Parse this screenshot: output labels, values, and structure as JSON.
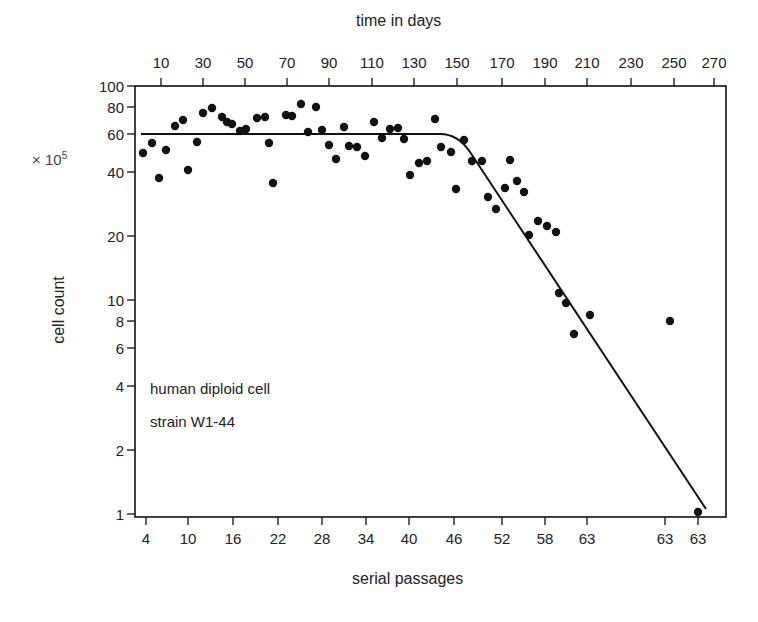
{
  "chart_data": {
    "type": "scatter",
    "title": "",
    "top_xlabel": "time in days",
    "xlabel": "serial passages",
    "ylabel": "cell count",
    "y_multiplier": "× 10^5",
    "y_scale": "log",
    "ylim": [
      1,
      100
    ],
    "grid": false,
    "legend": null,
    "annotation": [
      "human diploid cell",
      "strain W1-44"
    ],
    "y_ticks": [
      100,
      80,
      60,
      40,
      20,
      10,
      8,
      6,
      4,
      2,
      1
    ],
    "bottom_x_ticks": [
      "4",
      "10",
      "16",
      "22",
      "28",
      "34",
      "40",
      "46",
      "52",
      "58",
      "63",
      "63",
      "63"
    ],
    "top_x_ticks": [
      "10",
      "30",
      "50",
      "70",
      "90",
      "110",
      "130",
      "150",
      "170",
      "190",
      "210",
      "230",
      "250",
      "270"
    ],
    "series": [
      {
        "name": "observed cell count",
        "kind": "points",
        "x_days": [
          2,
          6,
          9,
          13,
          17,
          21,
          23,
          27,
          30,
          34,
          39,
          41,
          43,
          47,
          50,
          55,
          59,
          61,
          63,
          69,
          72,
          76,
          80,
          84,
          86,
          90,
          93,
          98,
          100,
          104,
          108,
          112,
          116,
          120,
          124,
          127,
          130,
          134,
          138,
          142,
          145,
          149,
          151,
          155,
          159,
          164,
          167,
          170,
          174,
          177,
          180,
          183,
          186,
          190,
          194,
          198,
          200,
          203,
          207,
          215,
          252,
          265
        ],
        "y_count_e5": [
          50,
          56,
          38,
          52,
          68,
          72,
          41,
          57,
          76,
          80,
          70,
          67,
          66,
          62,
          63,
          71,
          72,
          55,
          36,
          74,
          74,
          84,
          61,
          81,
          63,
          53,
          46,
          64,
          53,
          52,
          48,
          69,
          58,
          64,
          65,
          58,
          39,
          44,
          45,
          73,
          53,
          50,
          33,
          56,
          45,
          45,
          30,
          26,
          33,
          46,
          35,
          30,
          20,
          23,
          22,
          21,
          11,
          10,
          7.3,
          8.8,
          8.4,
          1
        ]
      },
      {
        "name": "fitted curve",
        "kind": "line",
        "description": "Flat plateau at ~60 ×10^5 until ~passage 44 (~140 days), then exponential decline to ~1 ×10^5 by ~passage 63 (~268 days)",
        "x_days": [
          2,
          140,
          148,
          155,
          268
        ],
        "y_count_e5": [
          60,
          60,
          57,
          48,
          1.05
        ]
      }
    ]
  },
  "labels": {
    "top_axis_title": "time in days",
    "bottom_axis_title": "serial passages",
    "y_axis_title": "cell count",
    "y_multiplier": "× 10",
    "y_multiplier_exp": "5",
    "annotation_line1": "human diploid cell",
    "annotation_line2": "strain W1-44"
  },
  "ticks": {
    "top": [
      {
        "label": "10",
        "x": 161
      },
      {
        "label": "30",
        "x": 203
      },
      {
        "label": "50",
        "x": 245
      },
      {
        "label": "70",
        "x": 287
      },
      {
        "label": "90",
        "x": 329
      },
      {
        "label": "110",
        "x": 372
      },
      {
        "label": "130",
        "x": 414
      },
      {
        "label": "150",
        "x": 457
      },
      {
        "label": "170",
        "x": 502
      },
      {
        "label": "190",
        "x": 545
      },
      {
        "label": "210",
        "x": 587
      },
      {
        "label": "230",
        "x": 631
      },
      {
        "label": "250",
        "x": 674
      },
      {
        "label": "270",
        "x": 714
      }
    ],
    "bottom": [
      {
        "label": "4",
        "x": 146
      },
      {
        "label": "10",
        "x": 188
      },
      {
        "label": "16",
        "x": 233
      },
      {
        "label": "22",
        "x": 278
      },
      {
        "label": "28",
        "x": 322
      },
      {
        "label": "34",
        "x": 366
      },
      {
        "label": "40",
        "x": 409
      },
      {
        "label": "46",
        "x": 454
      },
      {
        "label": "52",
        "x": 502
      },
      {
        "label": "58",
        "x": 545
      },
      {
        "label": "63",
        "x": 587
      },
      {
        "label": "63",
        "x": 665
      },
      {
        "label": "63",
        "x": 698
      }
    ],
    "left": [
      {
        "label": "100",
        "y": 86
      },
      {
        "label": "80",
        "y": 107
      },
      {
        "label": "60",
        "y": 134
      },
      {
        "label": "40",
        "y": 172
      },
      {
        "label": "20",
        "y": 236
      },
      {
        "label": "10",
        "y": 300
      },
      {
        "label": "8",
        "y": 321
      },
      {
        "label": "6",
        "y": 348
      },
      {
        "label": "4",
        "y": 386
      },
      {
        "label": "2",
        "y": 450
      },
      {
        "label": "1",
        "y": 514
      }
    ]
  },
  "points_px": [
    [
      143,
      153
    ],
    [
      152,
      143
    ],
    [
      159,
      178
    ],
    [
      166,
      150
    ],
    [
      175,
      126
    ],
    [
      183,
      120
    ],
    [
      188,
      170
    ],
    [
      197,
      142
    ],
    [
      203,
      113
    ],
    [
      212,
      108
    ],
    [
      222,
      117
    ],
    [
      227,
      122
    ],
    [
      232,
      124
    ],
    [
      240,
      131
    ],
    [
      246,
      129
    ],
    [
      257,
      118
    ],
    [
      265,
      117
    ],
    [
      269,
      143
    ],
    [
      273,
      183
    ],
    [
      286,
      115
    ],
    [
      292,
      116
    ],
    [
      301,
      104
    ],
    [
      308,
      132
    ],
    [
      316,
      107
    ],
    [
      322,
      130
    ],
    [
      329,
      145
    ],
    [
      336,
      159
    ],
    [
      344,
      127
    ],
    [
      349,
      146
    ],
    [
      357,
      147
    ],
    [
      365,
      156
    ],
    [
      374,
      122
    ],
    [
      382,
      138
    ],
    [
      390,
      129
    ],
    [
      398,
      128
    ],
    [
      404,
      139
    ],
    [
      410,
      175
    ],
    [
      419,
      163
    ],
    [
      427,
      161
    ],
    [
      435,
      119
    ],
    [
      441,
      147
    ],
    [
      451,
      152
    ],
    [
      456,
      189
    ],
    [
      464,
      140
    ],
    [
      472,
      161
    ],
    [
      482,
      161
    ],
    [
      488,
      197
    ],
    [
      496,
      209
    ],
    [
      505,
      188
    ],
    [
      510,
      160
    ],
    [
      517,
      181
    ],
    [
      524,
      192
    ],
    [
      529,
      235
    ],
    [
      538,
      221
    ],
    [
      547,
      226
    ],
    [
      556,
      232
    ],
    [
      559,
      293
    ],
    [
      566,
      303
    ],
    [
      574,
      334
    ],
    [
      590,
      315
    ],
    [
      670,
      321
    ],
    [
      698,
      512
    ]
  ],
  "curve_px": "M141,134 L440,134 Q458,134 470,152 L706,509",
  "colors": {
    "ink": "#111111",
    "text": "#222222",
    "background": "#ffffff"
  }
}
